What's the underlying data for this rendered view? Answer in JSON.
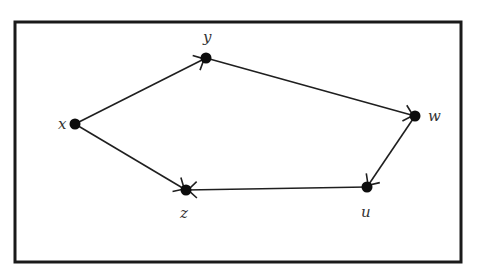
{
  "diagram": {
    "type": "directed-graph",
    "nodes": [
      {
        "id": "x",
        "label": "x"
      },
      {
        "id": "y",
        "label": "y"
      },
      {
        "id": "w",
        "label": "w"
      },
      {
        "id": "u",
        "label": "u"
      },
      {
        "id": "z",
        "label": "z"
      }
    ],
    "edges": [
      {
        "from": "x",
        "to": "y"
      },
      {
        "from": "y",
        "to": "w"
      },
      {
        "from": "w",
        "to": "u"
      },
      {
        "from": "u",
        "to": "z"
      },
      {
        "from": "x",
        "to": "z"
      }
    ]
  }
}
